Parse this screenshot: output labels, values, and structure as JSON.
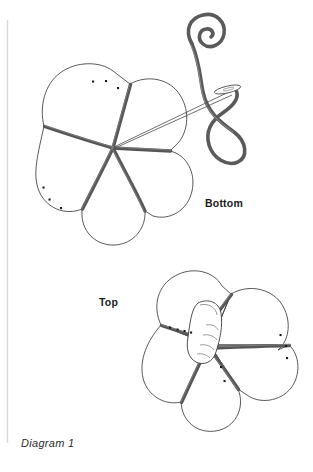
{
  "figure": {
    "caption": "Diagram 1",
    "labels": {
      "bottom": "Bottom",
      "top": "Top"
    },
    "colors": {
      "page_background": "#ffffff",
      "outline_stroke": "#3a3a3a",
      "seam_stroke": "#565656",
      "thread_stroke": "#5a5a5a",
      "needle_stroke": "#4a4a4a",
      "dot_fill": "#1a1a1a",
      "margin_rule": "#d8d8d8",
      "text_color": "#1a1a1a",
      "caption_color": "#2b2b2b"
    },
    "elements": {
      "margin_rule_name": "page-margin-rule",
      "upper_assembly_name": "upper-pincushion-bottom-view",
      "lower_assembly_name": "lower-pincushion-top-view",
      "needle_name": "sewing-needle",
      "thread_name": "curled-thread",
      "thumb_name": "thumb-holding-center"
    },
    "counts": {
      "petals_upper": 5,
      "petals_lower": 5,
      "seams_upper": 5,
      "seams_lower": 5,
      "stitch_dots_upper": 6,
      "stitch_dots_lower": 9
    }
  }
}
